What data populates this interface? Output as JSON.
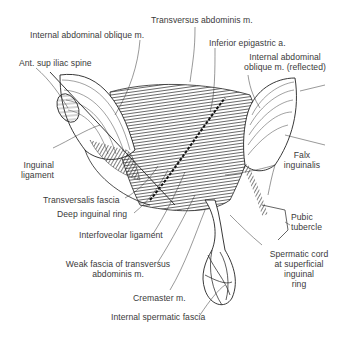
{
  "figure": {
    "type": "anatomical illustration",
    "line_color": "#222222",
    "background": "#ffffff"
  },
  "labels": {
    "transversus_abdominis": "Transversus abdominis m.",
    "internal_oblique": "Internal abdominal oblique m.",
    "inferior_epigastric": "Inferior epigastric a.",
    "ant_sup_iliac_spine": "Ant. sup iliac spine",
    "internal_oblique_reflected_1": "Internal abdominal",
    "internal_oblique_reflected_2": "oblique m. (reflected)",
    "inguinal_ligament_1": "Inguinal",
    "inguinal_ligament_2": "ligament",
    "falx_inguinalis_1": "Falx",
    "falx_inguinalis_2": "inguinalis",
    "transversalis_fascia": "Transversalis fascia",
    "deep_inguinal_ring": "Deep inguinal ring",
    "pubic_tubercle_1": "Pubic",
    "pubic_tubercle_2": "tubercle",
    "interfoveolar_ligament": "Interfoveolar ligament",
    "spermatic_cord_1": "Spermatic cord",
    "spermatic_cord_2": "at superficial",
    "spermatic_cord_3": "inguinal",
    "spermatic_cord_4": "ring",
    "weak_fascia_1": "Weak fascia of transversus",
    "weak_fascia_2": "abdominis m.",
    "cremaster": "Cremaster m.",
    "internal_spermatic_fascia": "Internal spermatic fascia"
  }
}
